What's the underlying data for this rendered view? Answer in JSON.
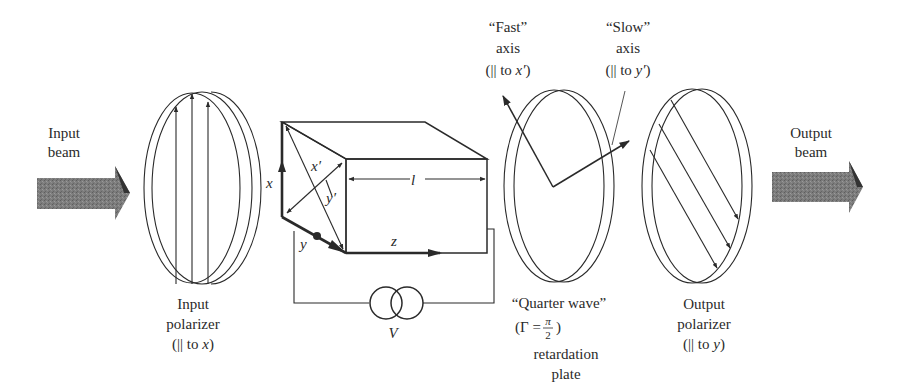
{
  "figure": {
    "colors": {
      "ink": "#2a2a2a",
      "beam_fill": "#7a7a7a",
      "beam_dark": "#3a3a3a",
      "plate_rim": "#dcdcdc"
    }
  },
  "input_beam": {
    "label_line1": "Input",
    "label_line2": "beam"
  },
  "input_polarizer": {
    "label_line1": "Input",
    "label_line2": "polarizer",
    "label_line3_prefix": "(|| to ",
    "label_line3_var": "x",
    "label_line3_suffix": ")"
  },
  "crystal": {
    "axis_x": "x",
    "axis_y": "y",
    "axis_z": "z",
    "axis_x_prime": "x′",
    "axis_y_prime": "y′",
    "length_label": "l"
  },
  "voltage_source": {
    "label": "V"
  },
  "quarter_wave_plate": {
    "fast_axis_line1": "“Fast”",
    "fast_axis_line2": "axis",
    "fast_axis_line3_prefix": "(|| to ",
    "fast_axis_line3_var": "x′",
    "fast_axis_line3_suffix": ")",
    "slow_axis_line1": "“Slow”",
    "slow_axis_line2": "axis",
    "slow_axis_line3_prefix": "(|| to ",
    "slow_axis_line3_var": "y′",
    "slow_axis_line3_suffix": ")",
    "label_line1": "“Quarter wave”",
    "gamma_prefix": "(Γ = ",
    "gamma_num": "π",
    "gamma_den": "2",
    "gamma_suffix": ")",
    "label_line3": "retardation",
    "label_line4": "plate"
  },
  "output_polarizer": {
    "label_line1": "Output",
    "label_line2": "polarizer",
    "label_line3_prefix": "(|| to ",
    "label_line3_var": "y",
    "label_line3_suffix": ")"
  },
  "output_beam": {
    "label_line1": "Output",
    "label_line2": "beam"
  }
}
